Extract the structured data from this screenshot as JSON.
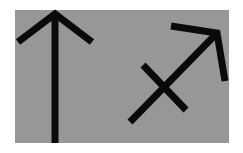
{
  "panel": {
    "background": "#979797"
  },
  "symbols": [
    {
      "name": "up-arrow",
      "color": "#0a0a0a"
    },
    {
      "name": "sagittarius-symbol",
      "color": "#0a0a0a"
    }
  ]
}
